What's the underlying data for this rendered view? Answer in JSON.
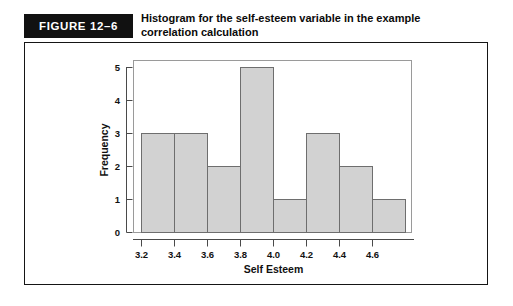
{
  "figure": {
    "badge_label": "FIGURE 12–6",
    "title_line1": "Histogram for the self-esteem variable in the example",
    "title_line2": "correlation calculation",
    "badge_bg": "#111111",
    "badge_text_color": "#ffffff",
    "frame_border_color": "#151515"
  },
  "chart_data": {
    "type": "bar",
    "title": "Histogram for the self-esteem variable in the example correlation calculation",
    "xlabel": "Self Esteem",
    "ylabel": "Frequency",
    "categories": [
      "3.1-3.3",
      "3.3-3.5",
      "3.5-3.7",
      "3.7-3.9",
      "3.9-4.1",
      "4.1-4.3",
      "4.3-4.5",
      "4.5-4.7"
    ],
    "values": [
      3,
      3,
      2,
      5,
      1,
      3,
      2,
      1
    ],
    "bin_edges": [
      3.1,
      3.3,
      3.5,
      3.7,
      3.9,
      4.1,
      4.3,
      4.5,
      4.7
    ],
    "x_tick_labels": [
      "3.2",
      "3.4",
      "3.6",
      "3.8",
      "4.0",
      "4.2",
      "4.4",
      "4.6"
    ],
    "x_tick_values": [
      3.2,
      3.4,
      3.6,
      3.8,
      4.0,
      4.2,
      4.4,
      4.6
    ],
    "y_tick_labels": [
      "0",
      "1",
      "2",
      "3",
      "4",
      "5"
    ],
    "y_tick_values": [
      0,
      1,
      2,
      3,
      4,
      5
    ],
    "ylim": [
      0,
      5
    ],
    "grid": false,
    "legend": null,
    "bar_fill_color": "#d2d2d2",
    "bar_edge_color": "#6e6e6e",
    "axis_color": "#4a4a4a"
  }
}
